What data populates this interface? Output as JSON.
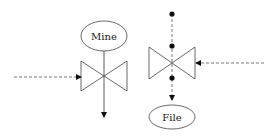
{
  "diagram": {
    "nodes": {
      "mine": {
        "label": "Mine",
        "shape": "ellipse"
      },
      "file": {
        "label": "File",
        "shape": "ellipse"
      },
      "valve_left": {
        "shape": "bowtie-valve"
      },
      "valve_right": {
        "shape": "bowtie-valve"
      }
    },
    "edges": [
      {
        "from": "left-input",
        "to": "valve_left",
        "style": "dashed"
      },
      {
        "from": "mine",
        "to": "down-output",
        "style": "solid",
        "through": "valve_left"
      },
      {
        "from": "right-input",
        "to": "valve_right",
        "style": "dashed"
      },
      {
        "from": "top-dot",
        "to": "file",
        "style": "dashed",
        "through": "valve_right"
      }
    ],
    "colors": {
      "stroke": "#333333",
      "background": "#ffffff"
    }
  }
}
